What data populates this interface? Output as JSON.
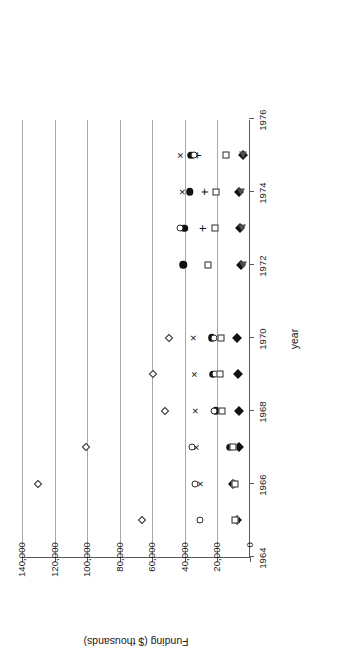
{
  "chart_data": {
    "type": "scatter",
    "title": "",
    "xlabel": "year",
    "ylabel": "Funding ($ thousands)",
    "xlim": [
      1964,
      1976
    ],
    "ylim": [
      0,
      140000
    ],
    "xticks": [
      "1964",
      "1966",
      "1968",
      "1970",
      "1972",
      "1974",
      "1976"
    ],
    "xtick_values": [
      1964,
      1966,
      1968,
      1970,
      1972,
      1974,
      1976
    ],
    "yticks": [
      "0",
      "20,000",
      "40,000",
      "60,000",
      "80,000",
      "100,000",
      "120,000",
      "140,000"
    ],
    "ytick_values": [
      0,
      20000,
      40000,
      60000,
      80000,
      100000,
      120000,
      140000
    ],
    "grid": "horizontal",
    "legend_position": "top",
    "series": [
      {
        "name": "I. Nature of Water",
        "marker": "filled-diamond",
        "color": "#111111",
        "points": [
          {
            "x": 1965,
            "y": 8000
          },
          {
            "x": 1966,
            "y": 10500
          },
          {
            "x": 1967,
            "y": 6500
          },
          {
            "x": 1968,
            "y": 7000
          },
          {
            "x": 1969,
            "y": 7500
          },
          {
            "x": 1970,
            "y": 8000
          },
          {
            "x": 1972,
            "y": 5500
          },
          {
            "x": 1973,
            "y": 6000
          },
          {
            "x": 1974,
            "y": 7000
          },
          {
            "x": 1975,
            "y": 4500
          }
        ]
      },
      {
        "name": "IV. Water Quantity Management and Control",
        "marker": "x",
        "color": "#111111",
        "points": [
          {
            "x": 1965,
            "y": 31500
          },
          {
            "x": 1966,
            "y": 30500
          },
          {
            "x": 1967,
            "y": 33000
          },
          {
            "x": 1968,
            "y": 34000
          },
          {
            "x": 1969,
            "y": 34500
          },
          {
            "x": 1970,
            "y": 35000
          },
          {
            "x": 1972,
            "y": 41000
          },
          {
            "x": 1973,
            "y": 41500
          },
          {
            "x": 1974,
            "y": 42000
          },
          {
            "x": 1975,
            "y": 43000
          }
        ]
      },
      {
        "name": "VI. Water Resources Planning and other Institutional Issues",
        "marker": "filled-circle",
        "color": "#111111",
        "points": [
          {
            "x": 1965,
            "y": 8500
          },
          {
            "x": 1966,
            "y": 10000
          },
          {
            "x": 1967,
            "y": 12500
          },
          {
            "x": 1968,
            "y": 21000
          },
          {
            "x": 1969,
            "y": 23000
          },
          {
            "x": 1970,
            "y": 23500
          },
          {
            "x": 1972,
            "y": 41000
          },
          {
            "x": 1973,
            "y": 40500
          },
          {
            "x": 1974,
            "y": 37000
          },
          {
            "x": 1975,
            "y": 36000
          }
        ]
      },
      {
        "name": "VII. Resources Data",
        "marker": "plus",
        "color": "#111111",
        "points": [
          {
            "x": 1966,
            "y": 11500
          },
          {
            "x": 1972,
            "y": 26500
          },
          {
            "x": 1973,
            "y": 29500
          },
          {
            "x": 1974,
            "y": 28000
          },
          {
            "x": 1975,
            "y": 32500
          }
        ]
      },
      {
        "name": "VIII. Engineering Works",
        "marker": "open-circle",
        "color": "#2a2a2a",
        "points": [
          {
            "x": 1965,
            "y": 30500
          },
          {
            "x": 1966,
            "y": 33500
          },
          {
            "x": 1967,
            "y": 35500
          },
          {
            "x": 1968,
            "y": 22000
          },
          {
            "x": 1969,
            "y": 21500
          },
          {
            "x": 1970,
            "y": 22000
          },
          {
            "x": 1973,
            "y": 43000
          },
          {
            "x": 1975,
            "y": 34500
          }
        ]
      },
      {
        "name": "IX. Manpower, Grants, and Facilities",
        "marker": "open-diamond",
        "color": "#2a2a2a",
        "points": [
          {
            "x": 1965,
            "y": 66500
          },
          {
            "x": 1966,
            "y": 130000
          },
          {
            "x": 1967,
            "y": 101000
          },
          {
            "x": 1968,
            "y": 52000
          },
          {
            "x": 1969,
            "y": 59500
          },
          {
            "x": 1970,
            "y": 49500
          }
        ]
      },
      {
        "name": "X. Scientific and Technical Information",
        "marker": "filled-triangle",
        "color": "#4d4d4d",
        "points": [
          {
            "x": 1972,
            "y": 4500
          },
          {
            "x": 1973,
            "y": 5000
          },
          {
            "x": 1974,
            "y": 5500
          },
          {
            "x": 1975,
            "y": 4500
          }
        ]
      },
      {
        "name": "XI. Aquatic Ecosystem Management and Protection",
        "marker": "open-square",
        "color": "#2a2a2a",
        "points": [
          {
            "x": 1965,
            "y": 9000
          },
          {
            "x": 1966,
            "y": 9500
          },
          {
            "x": 1967,
            "y": 10500
          },
          {
            "x": 1968,
            "y": 17000
          },
          {
            "x": 1969,
            "y": 18500
          },
          {
            "x": 1970,
            "y": 18000
          },
          {
            "x": 1972,
            "y": 26000
          },
          {
            "x": 1973,
            "y": 21500
          },
          {
            "x": 1974,
            "y": 21000
          },
          {
            "x": 1975,
            "y": 14500
          }
        ]
      }
    ]
  }
}
